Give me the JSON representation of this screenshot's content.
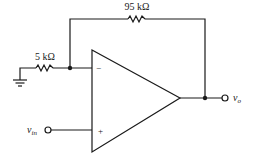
{
  "diagram": {
    "type": "non-inverting op-amp amplifier",
    "components": {
      "feedback_resistor": {
        "label": "95 kΩ"
      },
      "ground_resistor": {
        "label": "5 kΩ"
      },
      "opamp": {
        "inverting_sign": "−",
        "noninverting_sign": "+"
      }
    },
    "terminals": {
      "input": {
        "label_main": "v",
        "label_sub": "in"
      },
      "output": {
        "label_main": "v",
        "label_sub": "o"
      }
    },
    "colors": {
      "line": "#1a1a1a",
      "background": "#ffffff"
    }
  }
}
